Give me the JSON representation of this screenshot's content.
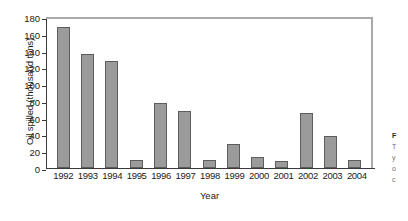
{
  "chart_data": {
    "type": "bar",
    "title": "",
    "xlabel": "Year",
    "ylabel": "Oil spilled (thousand tons)",
    "categories": [
      "1992",
      "1993",
      "1994",
      "1995",
      "1996",
      "1997",
      "1998",
      "1999",
      "2000",
      "2001",
      "2002",
      "2003",
      "2004"
    ],
    "values": [
      168,
      136,
      127,
      9,
      77,
      68,
      9,
      29,
      13,
      8,
      65,
      38,
      9
    ],
    "ylim": [
      0,
      180
    ],
    "yticks": [
      0,
      20,
      40,
      60,
      80,
      100,
      120,
      140,
      160,
      180
    ],
    "ytick_labels": [
      "0",
      "20",
      "40",
      "60",
      "80",
      "100",
      "120",
      "140",
      "160",
      "180"
    ],
    "grid": false,
    "legend": false,
    "bar_color": "#9b9b9b",
    "bar_border_color": "#5d5d5d",
    "frame_color": "#a9a9a9",
    "axis_color": "#3a3a3a"
  },
  "caption_fragment": {
    "line1": "F",
    "line2": "T",
    "line3": "y",
    "line4": "o",
    "line5": "c"
  }
}
